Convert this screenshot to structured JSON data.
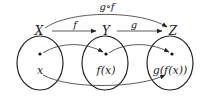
{
  "diagram": {
    "sets": [
      {
        "name": "X",
        "element": "x"
      },
      {
        "name": "Y",
        "element": "f(x)"
      },
      {
        "name": "Z",
        "element": "g(f(x))"
      }
    ],
    "arrows": [
      {
        "label": "f",
        "from": "X",
        "to": "Y"
      },
      {
        "label": "g",
        "from": "Y",
        "to": "Z"
      },
      {
        "label": "g∘f",
        "from": "X",
        "to": "Z"
      }
    ],
    "colors": {
      "stroke": "#222222",
      "background": "#ffffff"
    }
  }
}
